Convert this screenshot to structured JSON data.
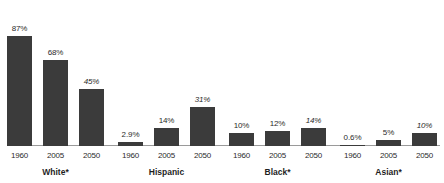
{
  "chart_data": {
    "type": "bar",
    "title": "",
    "subtitle": "",
    "xlabel": "",
    "ylabel": "",
    "ylim": [
      0,
      100
    ],
    "grid": false,
    "legend": "none",
    "categories": [
      "White*",
      "Hispanic",
      "Black*",
      "Asian*"
    ],
    "x": [
      "1960",
      "2005",
      "2050"
    ],
    "series": [
      {
        "name": "1960",
        "values": [
          87,
          2.9,
          10,
          0.6
        ]
      },
      {
        "name": "2005",
        "values": [
          68,
          14,
          12,
          5
        ]
      },
      {
        "name": "2050",
        "values": [
          45,
          31,
          14,
          10
        ]
      }
    ],
    "groups": [
      {
        "label": "White*",
        "bars": [
          {
            "year": "1960",
            "value": 87,
            "value_label": "87%",
            "projected": false
          },
          {
            "year": "2005",
            "value": 68,
            "value_label": "68%",
            "projected": false
          },
          {
            "year": "2050",
            "value": 45,
            "value_label": "45%",
            "projected": true
          }
        ]
      },
      {
        "label": "Hispanic",
        "bars": [
          {
            "year": "1960",
            "value": 2.9,
            "value_label": "2.9%",
            "projected": false
          },
          {
            "year": "2005",
            "value": 14,
            "value_label": "14%",
            "projected": false
          },
          {
            "year": "2050",
            "value": 31,
            "value_label": "31%",
            "projected": true
          }
        ]
      },
      {
        "label": "Black*",
        "bars": [
          {
            "year": "1960",
            "value": 10,
            "value_label": "10%",
            "projected": false
          },
          {
            "year": "2005",
            "value": 12,
            "value_label": "12%",
            "projected": false
          },
          {
            "year": "2050",
            "value": 14,
            "value_label": "14%",
            "projected": true
          }
        ]
      },
      {
        "label": "Asian*",
        "bars": [
          {
            "year": "1960",
            "value": 0.6,
            "value_label": "0.6%",
            "projected": false
          },
          {
            "year": "2005",
            "value": 5,
            "value_label": "5%",
            "projected": false
          },
          {
            "year": "2050",
            "value": 10,
            "value_label": "10%",
            "projected": true
          }
        ]
      }
    ],
    "colors": {
      "bar": "#3b3b3b",
      "axis": "#9a9a9a",
      "text": "#2b2b2b",
      "background": "#ffffff"
    }
  }
}
